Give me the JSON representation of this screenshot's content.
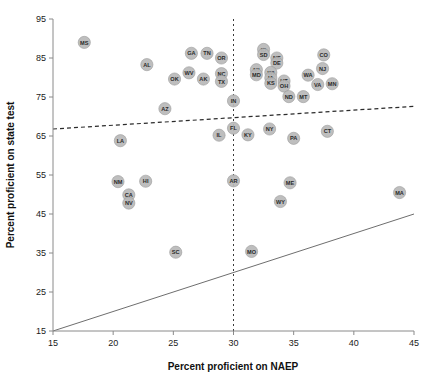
{
  "chart_data": {
    "type": "scatter",
    "title": "",
    "xlabel": "Percent proficient on NAEP",
    "ylabel": "Percent proficient on state test",
    "xlim": [
      15,
      45
    ],
    "ylim": [
      15,
      95
    ],
    "xticks": [
      15,
      20,
      25,
      30,
      35,
      40,
      45
    ],
    "yticks": [
      15,
      25,
      35,
      45,
      55,
      65,
      75,
      85,
      95
    ],
    "grid": false,
    "legend": null,
    "point_color": "#b8b8b8",
    "reference_lines": [
      {
        "name": "identity-line",
        "style": "solid",
        "desc": "y = x",
        "x": [
          15,
          45
        ],
        "y": [
          15,
          45
        ]
      },
      {
        "name": "regression-line",
        "style": "dashed",
        "desc": "fitted trend",
        "x": [
          15,
          45
        ],
        "y": [
          66.8,
          72.6
        ]
      },
      {
        "name": "naep-30-line",
        "style": "dashed-vertical",
        "desc": "x = 30",
        "x": 30
      }
    ],
    "points": [
      {
        "label": "MS",
        "x": 17.6,
        "y": 89.0
      },
      {
        "label": "AL",
        "x": 22.8,
        "y": 83.3
      },
      {
        "label": "OK",
        "x": 25.1,
        "y": 79.6
      },
      {
        "label": "WV",
        "x": 26.3,
        "y": 81.2
      },
      {
        "label": "AK",
        "x": 27.5,
        "y": 79.6
      },
      {
        "label": "GA",
        "x": 26.5,
        "y": 86.2
      },
      {
        "label": "TN",
        "x": 27.8,
        "y": 86.2
      },
      {
        "label": "OR",
        "x": 29.0,
        "y": 85.0
      },
      {
        "label": "NC",
        "x": 29.0,
        "y": 81.0
      },
      {
        "label": "TX",
        "x": 29.0,
        "y": 79.0
      },
      {
        "label": "AZ",
        "x": 24.3,
        "y": 72.0
      },
      {
        "label": "LA",
        "x": 20.6,
        "y": 63.8
      },
      {
        "label": "NM",
        "x": 20.4,
        "y": 53.3
      },
      {
        "label": "HI",
        "x": 22.7,
        "y": 53.4
      },
      {
        "label": "CA",
        "x": 21.3,
        "y": 49.9
      },
      {
        "label": "NV",
        "x": 21.3,
        "y": 47.8
      },
      {
        "label": "SC",
        "x": 25.2,
        "y": 35.2
      },
      {
        "label": "IN",
        "x": 30.0,
        "y": 74.0
      },
      {
        "label": "FL",
        "x": 30.0,
        "y": 67.0
      },
      {
        "label": "AR",
        "x": 30.0,
        "y": 53.5
      },
      {
        "label": "MO",
        "x": 31.5,
        "y": 35.4
      },
      {
        "label": "IL",
        "x": 28.8,
        "y": 65.2
      },
      {
        "label": "KY",
        "x": 31.2,
        "y": 65.3
      },
      {
        "label": "NY",
        "x": 33.0,
        "y": 66.8
      },
      {
        "label": "ID",
        "x": 32.5,
        "y": 87.2
      },
      {
        "label": "SD",
        "x": 32.5,
        "y": 85.9
      },
      {
        "label": "NE",
        "x": 33.6,
        "y": 85.0
      },
      {
        "label": "DE",
        "x": 33.6,
        "y": 83.7
      },
      {
        "label": "MI",
        "x": 31.9,
        "y": 82.0
      },
      {
        "label": "MD",
        "x": 31.9,
        "y": 80.7
      },
      {
        "label": "WI",
        "x": 33.1,
        "y": 81.3
      },
      {
        "label": "IA",
        "x": 33.1,
        "y": 79.9
      },
      {
        "label": "KS",
        "x": 33.1,
        "y": 78.5
      },
      {
        "label": "UT",
        "x": 34.2,
        "y": 79.1
      },
      {
        "label": "OH",
        "x": 34.2,
        "y": 77.8
      },
      {
        "label": "ND",
        "x": 34.6,
        "y": 75.1
      },
      {
        "label": "MT",
        "x": 35.8,
        "y": 75.1
      },
      {
        "label": "WA",
        "x": 36.2,
        "y": 80.6
      },
      {
        "label": "NJ",
        "x": 37.4,
        "y": 82.3
      },
      {
        "label": "CO",
        "x": 37.5,
        "y": 85.8
      },
      {
        "label": "VA",
        "x": 37.0,
        "y": 78.2
      },
      {
        "label": "MN",
        "x": 38.2,
        "y": 78.4
      },
      {
        "label": "PA",
        "x": 35.0,
        "y": 64.4
      },
      {
        "label": "CT",
        "x": 37.8,
        "y": 66.2
      },
      {
        "label": "ME",
        "x": 34.7,
        "y": 53.0
      },
      {
        "label": "WY",
        "x": 33.9,
        "y": 48.2
      },
      {
        "label": "MA",
        "x": 43.8,
        "y": 50.5
      }
    ]
  }
}
